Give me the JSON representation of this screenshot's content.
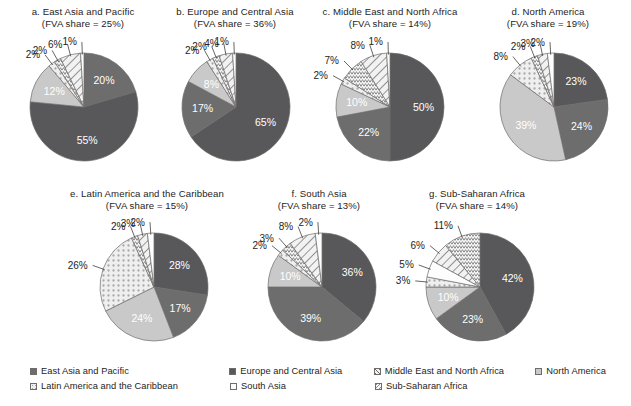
{
  "figure": {
    "background_color": "#ffffff",
    "text_color": "#262322"
  },
  "palette": {
    "east_asia_and_pacific": "#6d6d6d",
    "europe_and_central_asia": "#58585a",
    "middle_east_and_north_africa": "#f2f2f2",
    "north_america": "#c9c9c9",
    "latin_america_and_the_caribbean": "#efefef",
    "south_asia": "#fdfdfd",
    "sub_saharan_africa": "#f7f7f7",
    "stroke": "#6f6c6a",
    "label_light": "#ffffff",
    "label_dark": "#262322"
  },
  "legend": {
    "rows": [
      [
        {
          "label": "East Asia and Pacific",
          "swatch": "solid-dark-gray",
          "key": "east_asia_and_pacific"
        },
        {
          "label": "Europe and Central Asia",
          "swatch": "solid-darker-gray",
          "key": "europe_and_central_asia"
        },
        {
          "label": "Middle East and North Africa",
          "swatch": "diagonal-hatch",
          "key": "middle_east_and_north_africa"
        },
        {
          "label": "North America",
          "swatch": "solid-light-gray",
          "key": "north_america"
        }
      ],
      [
        {
          "label": "Latin America and the Caribbean",
          "swatch": "dotted",
          "key": "latin_america_and_the_caribbean"
        },
        {
          "label": "South Asia",
          "swatch": "blank-white",
          "key": "south_asia"
        },
        {
          "label": "Sub-Saharan Africa",
          "swatch": "zigzag",
          "key": "sub_saharan_africa"
        }
      ]
    ]
  },
  "chart_data": [
    {
      "id": "a",
      "type": "pie",
      "title": "a. East Asia and Pacific",
      "subtitle": "(FVA share = 25%)",
      "fva_share": "25%",
      "categories": [
        "East Asia and Pacific",
        "Europe and Central Asia",
        "North America",
        "Latin America and the Caribbean",
        "Sub-Saharan Africa",
        "Middle East and North Africa",
        "South Asia"
      ],
      "values": [
        20,
        55,
        12,
        2,
        2,
        6,
        1
      ],
      "labels": [
        "20%",
        "55%",
        "12%",
        "2%",
        "2%",
        "6%",
        "1%"
      ],
      "fills": [
        "east_asia_and_pacific",
        "europe_and_central_asia",
        "north_america",
        "latin_america_and_the_caribbean",
        "sub_saharan_africa",
        "middle_east_and_north_africa",
        "south_asia"
      ],
      "inside": [
        true,
        true,
        true,
        false,
        false,
        false,
        false
      ]
    },
    {
      "id": "b",
      "type": "pie",
      "title": "b. Europe and Central Asia",
      "subtitle": "(FVA share = 36%)",
      "fva_share": "36%",
      "categories": [
        "Europe and Central Asia",
        "East Asia and Pacific",
        "North America",
        "Latin America and the Caribbean",
        "Sub-Saharan Africa",
        "Middle East and North Africa",
        "South Asia"
      ],
      "values": [
        65,
        17,
        8,
        2,
        2,
        4,
        1
      ],
      "labels": [
        "65%",
        "17%",
        "8%",
        "2%",
        "2%",
        "4%",
        "1%"
      ],
      "fills": [
        "europe_and_central_asia",
        "east_asia_and_pacific",
        "north_america",
        "latin_america_and_the_caribbean",
        "sub_saharan_africa",
        "middle_east_and_north_africa",
        "south_asia"
      ],
      "inside": [
        true,
        true,
        true,
        false,
        false,
        false,
        false
      ]
    },
    {
      "id": "c",
      "type": "pie",
      "title": "c. Middle East and North Africa",
      "subtitle": "(FVA share = 14%)",
      "fva_share": "14%",
      "categories": [
        "Europe and Central Asia",
        "East Asia and Pacific",
        "North America",
        "Latin America and the Caribbean",
        "Sub-Saharan Africa",
        "Middle East and North Africa",
        "South Asia"
      ],
      "values": [
        50,
        22,
        10,
        2,
        7,
        8,
        1
      ],
      "labels": [
        "50%",
        "22%",
        "10%",
        "2%",
        "7%",
        "8%",
        "1%"
      ],
      "fills": [
        "europe_and_central_asia",
        "east_asia_and_pacific",
        "north_america",
        "latin_america_and_the_caribbean",
        "sub_saharan_africa",
        "middle_east_and_north_africa",
        "south_asia"
      ],
      "inside": [
        true,
        true,
        true,
        false,
        false,
        false,
        false
      ]
    },
    {
      "id": "d",
      "type": "pie",
      "title": "d. North America",
      "subtitle": "(FVA share = 19%)",
      "fva_share": "19%",
      "categories": [
        "Europe and Central Asia",
        "East Asia and Pacific",
        "North America",
        "Latin America and the Caribbean",
        "Sub-Saharan Africa",
        "Middle East and North Africa",
        "South Asia"
      ],
      "values": [
        23,
        24,
        39,
        8,
        2,
        3,
        2
      ],
      "labels": [
        "23%",
        "24%",
        "39%",
        "8%",
        "2%",
        "3%",
        "2%"
      ],
      "fills": [
        "europe_and_central_asia",
        "east_asia_and_pacific",
        "north_america",
        "latin_america_and_the_caribbean",
        "sub_saharan_africa",
        "middle_east_and_north_africa",
        "south_asia"
      ],
      "inside": [
        true,
        true,
        true,
        false,
        false,
        false,
        false
      ]
    },
    {
      "id": "e",
      "type": "pie",
      "title": "e. Latin America and the Caribbean",
      "subtitle": "(FVA share = 15%)",
      "fva_share": "15%",
      "categories": [
        "Europe and Central Asia",
        "East Asia and Pacific",
        "North America",
        "Latin America and the Caribbean",
        "Sub-Saharan Africa",
        "Middle East and North Africa",
        "South Asia"
      ],
      "values": [
        28,
        17,
        24,
        26,
        2,
        3,
        2
      ],
      "labels": [
        "28%",
        "17%",
        "24%",
        "26%",
        "2%",
        "3%",
        "2%"
      ],
      "fills": [
        "europe_and_central_asia",
        "east_asia_and_pacific",
        "north_america",
        "latin_america_and_the_caribbean",
        "sub_saharan_africa",
        "middle_east_and_north_africa",
        "south_asia"
      ],
      "inside": [
        true,
        true,
        true,
        false,
        false,
        false,
        false
      ]
    },
    {
      "id": "f",
      "type": "pie",
      "title": "f. South Asia",
      "subtitle": "(FVA share = 13%)",
      "fva_share": "13%",
      "categories": [
        "Europe and Central Asia",
        "East Asia and Pacific",
        "North America",
        "Latin America and the Caribbean",
        "Sub-Saharan Africa",
        "Middle East and North Africa",
        "South Asia"
      ],
      "values": [
        36,
        39,
        10,
        2,
        3,
        8,
        2
      ],
      "labels": [
        "36%",
        "39%",
        "10%",
        "2%",
        "3%",
        "8%",
        "2%"
      ],
      "fills": [
        "europe_and_central_asia",
        "east_asia_and_pacific",
        "north_america",
        "latin_america_and_the_caribbean",
        "sub_saharan_africa",
        "middle_east_and_north_africa",
        "south_asia"
      ],
      "inside": [
        true,
        true,
        true,
        false,
        false,
        false,
        false
      ]
    },
    {
      "id": "g",
      "type": "pie",
      "title": "g. Sub-Saharan Africa",
      "subtitle": "(FVA share = 14%)",
      "fva_share": "14%",
      "categories": [
        "Europe and Central Asia",
        "East Asia and Pacific",
        "North America",
        "Latin America and the Caribbean",
        "South Asia",
        "Middle East and North Africa",
        "Sub-Saharan Africa"
      ],
      "values": [
        42,
        23,
        10,
        3,
        5,
        6,
        11
      ],
      "labels": [
        "42%",
        "23%",
        "10%",
        "3%",
        "5%",
        "6%",
        "11%"
      ],
      "fills": [
        "europe_and_central_asia",
        "east_asia_and_pacific",
        "north_america",
        "latin_america_and_the_caribbean",
        "south_asia",
        "middle_east_and_north_africa",
        "sub_saharan_africa"
      ],
      "inside": [
        true,
        true,
        true,
        false,
        false,
        false,
        false
      ]
    }
  ],
  "layout": {
    "positions": [
      {
        "id": "a",
        "left": 8,
        "top": 6,
        "width": 150,
        "cx": 76,
        "cy": 76,
        "r": 54
      },
      {
        "id": "b",
        "left": 160,
        "top": 6,
        "width": 150,
        "cx": 76,
        "cy": 76,
        "r": 54
      },
      {
        "id": "c",
        "left": 310,
        "top": 6,
        "width": 160,
        "cx": 80,
        "cy": 76,
        "r": 54
      },
      {
        "id": "d",
        "left": 472,
        "top": 6,
        "width": 152,
        "cx": 82,
        "cy": 76,
        "r": 54
      },
      {
        "id": "e",
        "left": 56,
        "top": 188,
        "width": 182,
        "cx": 98,
        "cy": 74,
        "r": 54
      },
      {
        "id": "f",
        "left": 244,
        "top": 188,
        "width": 150,
        "cx": 78,
        "cy": 74,
        "r": 54
      },
      {
        "id": "g",
        "left": 392,
        "top": 188,
        "width": 170,
        "cx": 88,
        "cy": 74,
        "r": 54
      }
    ]
  }
}
